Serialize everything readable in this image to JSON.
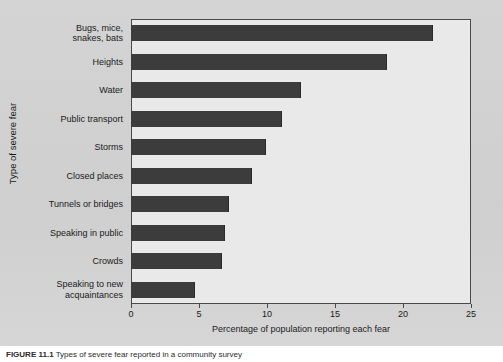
{
  "figure": {
    "caption_number": "FIGURE 11.1",
    "caption_text": "Types of severe fear reported in a community survey"
  },
  "chart_data": {
    "type": "bar",
    "orientation": "horizontal",
    "title": "",
    "categories": [
      "Bugs, mice,\nsnakes, bats",
      "Heights",
      "Water",
      "Public transport",
      "Storms",
      "Closed places",
      "Tunnels or bridges",
      "Speaking in public",
      "Crowds",
      "Speaking to new\nacquaintances"
    ],
    "values": [
      22.2,
      18.8,
      12.5,
      11.1,
      9.9,
      8.9,
      7.2,
      6.9,
      6.7,
      4.7
    ],
    "xlabel": "Percentage of population reporting each fear",
    "ylabel": "Type of severe fear",
    "xlim": [
      0,
      25
    ],
    "xticks": [
      0,
      5,
      10,
      15,
      20,
      25
    ],
    "xtick_labels": [
      "0",
      "5",
      "10",
      "15",
      "20",
      "25"
    ],
    "grid": false,
    "legend": false,
    "bar_color": "#3c3c3c",
    "plot_background": "#e9e9e9",
    "page_background": "#d2d2d2"
  }
}
